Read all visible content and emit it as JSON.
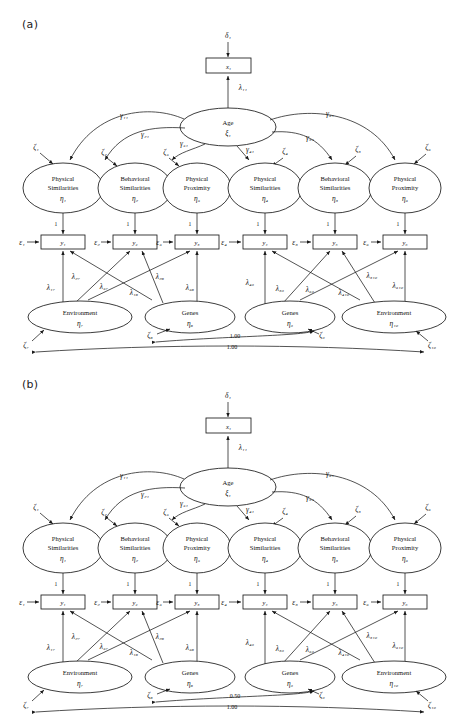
{
  "figure": {
    "panels": [
      {
        "label": "(a)",
        "id": "panel-a",
        "exogenous_indicator": {
          "disturbance": "δ₁",
          "box": "x₁",
          "loading": "γ₁₁_placeholder"
        },
        "measurement_loading_top": "λ₁₁",
        "exogenous_latent": {
          "name": "Age",
          "symbol": "ξ₁"
        },
        "structural_paths": [
          "γ₁₁",
          "γ₂₁",
          "γ₃₁",
          "γ₄₁",
          "γ₅₁",
          "γ₆₁"
        ],
        "endogenous_latents": [
          {
            "line1": "Physical",
            "line2": "Similarities",
            "symbol": "η₁",
            "disturbance": "ζ₁"
          },
          {
            "line1": "Behavioral",
            "line2": "Similarities",
            "symbol": "η₂",
            "disturbance": "ζ₂"
          },
          {
            "line1": "Physical",
            "line2": "Proximity",
            "symbol": "η₃",
            "disturbance": "ζ₃"
          },
          {
            "line1": "Physical",
            "line2": "Similarities",
            "symbol": "η₄",
            "disturbance": "ζ₄"
          },
          {
            "line1": "Behavioral",
            "line2": "Similarities",
            "symbol": "η₅",
            "disturbance": "ζ₅"
          },
          {
            "line1": "Physical",
            "line2": "Proximity",
            "symbol": "η₆",
            "disturbance": "ζ₆"
          }
        ],
        "indicators": [
          {
            "box": "y₁",
            "error": "ε₁",
            "fixed_loading": "1"
          },
          {
            "box": "y₂",
            "error": "ε₂",
            "fixed_loading": "1"
          },
          {
            "box": "y₃",
            "error": "ε₃",
            "fixed_loading": "1"
          },
          {
            "box": "y₄",
            "error": "ε₄",
            "fixed_loading": "1"
          },
          {
            "box": "y₅",
            "error": "ε₅",
            "fixed_loading": "1"
          },
          {
            "box": "y₆",
            "error": "ε₆",
            "fixed_loading": "1"
          }
        ],
        "source_latents": [
          {
            "name": "Environment",
            "symbol": "η₇",
            "disturbance": "ζ₇"
          },
          {
            "name": "Genes",
            "symbol": "η₈",
            "disturbance": "ζ₈"
          },
          {
            "name": "Genes",
            "symbol": "η₉",
            "disturbance": "ζ₉"
          },
          {
            "name": "Environment",
            "symbol": "η₁₀",
            "disturbance": "ζ₁₀"
          }
        ],
        "loadings_left_env": [
          "λ₁₇",
          "λ₂₇",
          "λ₃₇"
        ],
        "loadings_left_gen": [
          "λ₁₈",
          "λ₂₈",
          "λ₃₈"
        ],
        "loadings_right_gen": [
          "λ₄₉",
          "λ₅₉",
          "λ₆₉"
        ],
        "loadings_right_env": [
          "λ₄₁₀",
          "λ₅₁₀",
          "λ₆₁₀"
        ],
        "covariance_genes": "1.00",
        "covariance_environment": "1.00"
      },
      {
        "label": "(b)",
        "id": "panel-b",
        "exogenous_indicator": {
          "disturbance": "δ₁",
          "box": "x₁"
        },
        "measurement_loading_top": "λ₁₁",
        "exogenous_latent": {
          "name": "Age",
          "symbol": "ξ₁"
        },
        "structural_paths": [
          "γ₁₁",
          "γ₂₁",
          "γ₃₁",
          "γ₄₁",
          "γ₅₁",
          "γ₆₁"
        ],
        "endogenous_latents": [
          {
            "line1": "Physical",
            "line2": "Similarities",
            "symbol": "η₁",
            "disturbance": "ζ₁"
          },
          {
            "line1": "Behavioral",
            "line2": "Similarities",
            "symbol": "η₂",
            "disturbance": "ζ₂"
          },
          {
            "line1": "Physical",
            "line2": "Proximity",
            "symbol": "η₃",
            "disturbance": "ζ₃"
          },
          {
            "line1": "Physical",
            "line2": "Similarities",
            "symbol": "η₄",
            "disturbance": "ζ₄"
          },
          {
            "line1": "Behavioral",
            "line2": "Similarities",
            "symbol": "η₅",
            "disturbance": "ζ₅"
          },
          {
            "line1": "Physical",
            "line2": "Proximity",
            "symbol": "η₆",
            "disturbance": "ζ₆"
          }
        ],
        "indicators": [
          {
            "box": "y₁",
            "error": "ε₁",
            "fixed_loading": "1"
          },
          {
            "box": "y₂",
            "error": "ε₂",
            "fixed_loading": "1"
          },
          {
            "box": "y₃",
            "error": "ε₃",
            "fixed_loading": "1"
          },
          {
            "box": "y₄",
            "error": "ε₄",
            "fixed_loading": "1"
          },
          {
            "box": "y₅",
            "error": "ε₅",
            "fixed_loading": "1"
          },
          {
            "box": "y₆",
            "error": "ε₆",
            "fixed_loading": "1"
          }
        ],
        "source_latents": [
          {
            "name": "Environment",
            "symbol": "η₇",
            "disturbance": "ζ₇"
          },
          {
            "name": "Genes",
            "symbol": "η₈",
            "disturbance": "ζ₈"
          },
          {
            "name": "Genes",
            "symbol": "η₉",
            "disturbance": "ζ₉"
          },
          {
            "name": "Environment",
            "symbol": "η₁₀",
            "disturbance": "ζ₁₀"
          }
        ],
        "loadings_left_env": [
          "λ₁₇",
          "λ₂₇",
          "λ₃₇"
        ],
        "loadings_left_gen": [
          "λ₁₈",
          "λ₂₈",
          "λ₃₈"
        ],
        "loadings_right_gen": [
          "λ₄₉",
          "λ₅₉",
          "λ₆₉"
        ],
        "loadings_right_env": [
          "λ₄₁₀",
          "λ₅₁₀",
          "λ₆₁₀"
        ],
        "covariance_genes": "0.50",
        "covariance_environment": "1.00"
      }
    ]
  }
}
